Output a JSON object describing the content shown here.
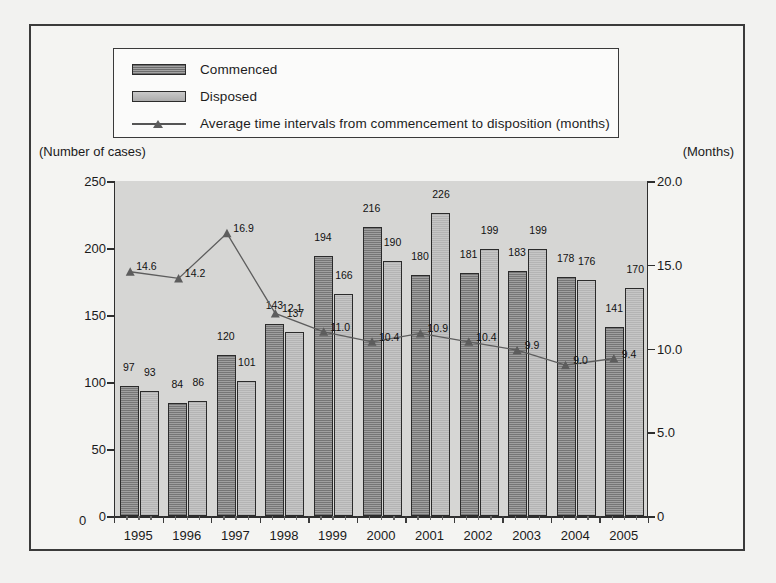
{
  "legend": {
    "items": [
      {
        "label": "Commenced",
        "icon": "bar-swatch-hatched"
      },
      {
        "label": "Disposed",
        "icon": "bar-swatch-light"
      },
      {
        "label": "Average time intervals from commencement to disposition (months)",
        "icon": "line-triangle-marker"
      }
    ]
  },
  "axis_captions": {
    "left": "(Number of cases)",
    "right": "(Months)"
  },
  "chart_data": {
    "type": "bar",
    "title": "",
    "subtitle": "",
    "xlabel": "",
    "ylabel": "(Number of cases)",
    "y2label": "(Months)",
    "grid": false,
    "legend_position": "top",
    "categories": [
      "1995",
      "1996",
      "1997",
      "1998",
      "1999",
      "2000",
      "2001",
      "2002",
      "2003",
      "2004",
      "2005"
    ],
    "ylim": [
      0,
      250
    ],
    "yticks": [
      "0",
      "50",
      "100",
      "150",
      "200",
      "250"
    ],
    "ytick_values": [
      0,
      50,
      100,
      150,
      200,
      250
    ],
    "y2lim": [
      0,
      20.0
    ],
    "y2ticks": [
      "0",
      "5.0",
      "10.0",
      "15.0",
      "20.0"
    ],
    "y2tick_values": [
      0,
      5.0,
      10.0,
      15.0,
      20.0
    ],
    "series": [
      {
        "name": "Commenced",
        "kind": "bar",
        "axis": "left",
        "color": "#8e8e8e",
        "values": [
          97,
          84,
          120,
          143,
          194,
          216,
          180,
          181,
          183,
          178,
          141
        ],
        "labels": [
          "97",
          "84",
          "120",
          "143",
          "194",
          "216",
          "180",
          "181",
          "183",
          "178",
          "141"
        ]
      },
      {
        "name": "Disposed",
        "kind": "bar",
        "axis": "left",
        "color": "#bcbcbc",
        "values": [
          93,
          86,
          101,
          137,
          166,
          190,
          226,
          199,
          199,
          176,
          170
        ],
        "labels": [
          "93",
          "86",
          "101",
          "137",
          "166",
          "190",
          "226",
          "199",
          "199",
          "176",
          "170"
        ]
      },
      {
        "name": "Average time intervals from commencement to disposition (months)",
        "kind": "line",
        "axis": "right",
        "color": "#5d5d5d",
        "marker": "triangle",
        "values": [
          14.6,
          14.2,
          16.9,
          12.1,
          11.0,
          10.4,
          10.9,
          10.4,
          9.9,
          9.0,
          9.4
        ],
        "labels": [
          "14.6",
          "14.2",
          "16.9",
          "12.1",
          "11.0",
          "10.4",
          "10.9",
          "10.4",
          "9.9",
          "9.0",
          "9.4"
        ]
      }
    ]
  },
  "colors": {
    "frame_border": "#3b3b3b",
    "page_background": "#f2f2f0",
    "plot_background": "#d6d6d4",
    "commenced_fill": "#8e8e8e",
    "disposed_fill": "#bcbcbc",
    "line_color": "#5d5d5d",
    "axis_color": "#2e2e2e"
  }
}
